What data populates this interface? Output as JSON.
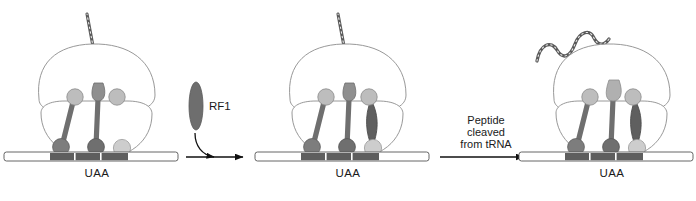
{
  "figure": {
    "background_color": "#ffffff",
    "colors": {
      "ribosome_outline": "#8c8c8c",
      "ribosome_fill": "#ffffff",
      "mrna_fill": "#ffffff",
      "mrna_outline": "#555555",
      "codon_dark": "#5e5e5e",
      "trna_dark": "#6b6b6b",
      "trna_mid": "#9a9a9a",
      "trna_light": "#c3c3c3",
      "release_factor": "#6e6e6e",
      "peptide_chain": "#5a5a5a",
      "text": "#1a1a1a",
      "arrow": "#111111"
    }
  },
  "panels": [
    {
      "id": "panel-1",
      "name": "elongation-complex-stop-codon",
      "codon_label": "UAA",
      "sites": [
        {
          "site": "E",
          "occupant": "tRNA",
          "has_peptide": false
        },
        {
          "site": "P",
          "occupant": "tRNA",
          "has_peptide": true
        },
        {
          "site": "A",
          "occupant": "empty",
          "has_peptide": false
        }
      ],
      "nascent_peptide_visible": true,
      "released_peptide_visible": false
    },
    {
      "id": "panel-2",
      "name": "rf1-bound-complex",
      "codon_label": "UAA",
      "sites": [
        {
          "site": "E",
          "occupant": "tRNA",
          "has_peptide": false
        },
        {
          "site": "P",
          "occupant": "tRNA",
          "has_peptide": true
        },
        {
          "site": "A",
          "occupant": "RF1",
          "has_peptide": false
        }
      ],
      "nascent_peptide_visible": true,
      "released_peptide_visible": false
    },
    {
      "id": "panel-3",
      "name": "peptide-released-complex",
      "codon_label": "UAA",
      "sites": [
        {
          "site": "E",
          "occupant": "tRNA",
          "has_peptide": false
        },
        {
          "site": "P",
          "occupant": "tRNA",
          "has_peptide": false
        },
        {
          "site": "A",
          "occupant": "RF1",
          "has_peptide": false
        }
      ],
      "nascent_peptide_visible": false,
      "released_peptide_visible": true
    }
  ],
  "molecules": {
    "release_factor": {
      "label": "RF1",
      "shape": "vertical-ellipse",
      "color": "#6e6e6e"
    }
  },
  "transitions": [
    {
      "id": "transition-1",
      "name": "rf1-binding",
      "lines": [],
      "has_curved_inlet_arrow": true,
      "inlet_molecule_label": "RF1"
    },
    {
      "id": "transition-2",
      "name": "peptide-cleavage",
      "lines": [
        "Peptide",
        "cleaved",
        "from tRNA"
      ],
      "has_curved_inlet_arrow": false,
      "inlet_molecule_label": ""
    }
  ]
}
